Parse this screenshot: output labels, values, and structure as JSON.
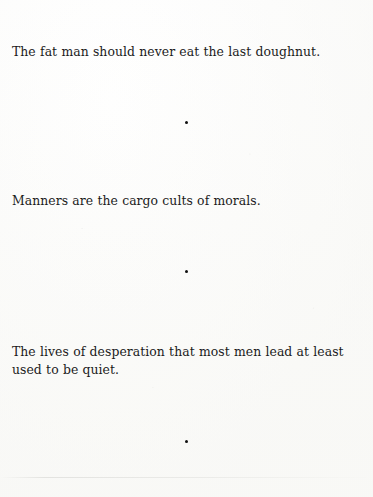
{
  "page": {
    "background_color": "#fdfdfd",
    "text_color": "#1b1b1b",
    "width": 373,
    "height": 497
  },
  "running_header": {
    "text": "BOOK",
    "note_visible": "clipped at top edge, illegible"
  },
  "entries": [
    {
      "id": "entry-1",
      "text": "The fat man should never eat the last doughnut."
    },
    {
      "id": "entry-2",
      "text": "Manners are the cargo cults of morals."
    },
    {
      "id": "entry-3",
      "text": "The lives of desperation that most men lead at least used to be quiet."
    }
  ],
  "separators": [
    {
      "id": "sep-1",
      "glyph": "bullet-dot"
    },
    {
      "id": "sep-2",
      "glyph": "bullet-dot"
    },
    {
      "id": "sep-3",
      "glyph": "bullet-dot"
    }
  ],
  "artifacts": {
    "scan_line": "faint horizontal scan edge near bottom"
  }
}
